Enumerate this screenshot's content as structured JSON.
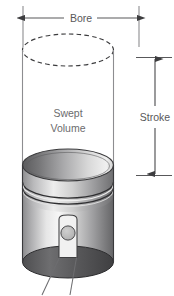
{
  "figure": {
    "labels": {
      "bore": "Bore",
      "stroke": "Stroke",
      "swept_volume_line1": "Swept",
      "swept_volume_line2": "Volume"
    },
    "colors": {
      "background": "#ffffff",
      "dimension_line": "#58585a",
      "label_text": "#58585a",
      "volume_text": "#6b6b6d",
      "cylinder_wall": "#8d8d90",
      "dashed_top": "#3b3b3d",
      "piston_outline": "#3a3a3c",
      "piston_light": "#f2f2f2",
      "piston_mid": "#b5b5b5",
      "piston_dark": "#4a4a4c",
      "pin_circle": "#b9b9b9",
      "leader_line": "#6d6d70"
    },
    "geometry": {
      "bore_dimension_y": 18,
      "bore_left_x": 22,
      "bore_right_x": 140,
      "stroke_dimension_x": 155,
      "stroke_top_y": 57,
      "stroke_bottom_y": 175,
      "cylinder_left_x": 22,
      "cylinder_right_x": 113,
      "dashed_ellipse_cy": 50,
      "piston_crown_cy": 165,
      "piston_bottom_cy": 262
    }
  }
}
